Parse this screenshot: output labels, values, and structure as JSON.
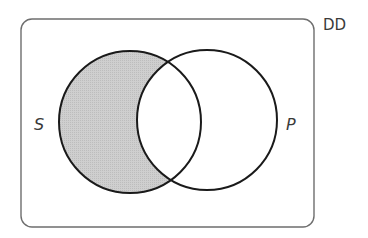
{
  "diagram": {
    "type": "venn",
    "universe_label": "DD",
    "sets": [
      {
        "name": "S",
        "label": "S"
      },
      {
        "name": "P",
        "label": "P"
      }
    ],
    "shaded_regions": [
      "S only (S and not P)"
    ],
    "colors": {
      "outline": "#1a1a1a",
      "frame": "#6e6e6e",
      "shade": "#c8c8c8",
      "background": "#ffffff",
      "text": "#3a3a3a"
    }
  }
}
